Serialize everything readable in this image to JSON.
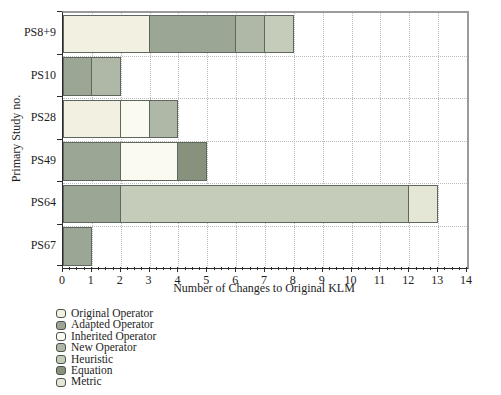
{
  "chart_data": {
    "type": "bar",
    "orientation": "horizontal",
    "stacked": true,
    "xlabel": "Number of Changes to Original KLM",
    "ylabel": "Primary Study no.",
    "xlim": [
      0,
      14
    ],
    "x_ticks": [
      0,
      1,
      2,
      3,
      4,
      5,
      6,
      7,
      8,
      9,
      10,
      11,
      12,
      13,
      14
    ],
    "minor_ticks_per_interval": 3,
    "grid": "dotted",
    "legend_position": "bottom-left",
    "categories": [
      "PS8+9",
      "PS10",
      "PS28",
      "PS49",
      "PS64",
      "PS67"
    ],
    "series": [
      {
        "name": "Original Operator",
        "color": "#f2f1e1",
        "values": [
          3,
          0,
          2,
          0,
          0,
          0
        ]
      },
      {
        "name": "Adapted Operator",
        "color": "#9ca695",
        "values": [
          3,
          1,
          0,
          2,
          2,
          1
        ]
      },
      {
        "name": "Inherited Operator",
        "color": "#fbfaf0",
        "values": [
          0,
          0,
          1,
          2,
          0,
          0
        ]
      },
      {
        "name": "New Operator",
        "color": "#afb7a7",
        "values": [
          1,
          1,
          1,
          0,
          0,
          0
        ]
      },
      {
        "name": "Heuristic",
        "color": "#c6ccba",
        "values": [
          1,
          0,
          0,
          0,
          10,
          0
        ]
      },
      {
        "name": "Equation",
        "color": "#87927c",
        "values": [
          0,
          0,
          0,
          1,
          0,
          0
        ]
      },
      {
        "name": "Metric",
        "color": "#e5e7d6",
        "values": [
          0,
          0,
          0,
          0,
          1,
          0
        ]
      }
    ],
    "totals": [
      8,
      2,
      4,
      5,
      13,
      1
    ],
    "colors": {
      "bar_border": "#5d675d",
      "frame": "#9b9b9b",
      "axis": "#2b2b2b",
      "grid": "#bcbcbc"
    }
  }
}
